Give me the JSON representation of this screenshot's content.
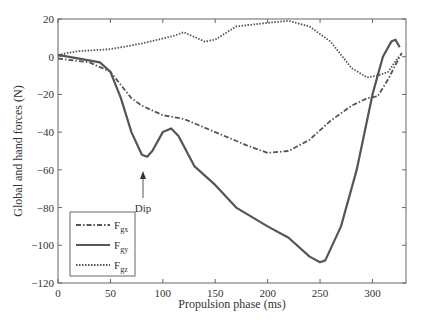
{
  "chart_data": {
    "type": "line",
    "title": "",
    "xlabel": "Propulsion phase (ms)",
    "ylabel": "Global and hand forces (N)",
    "xlim": [
      0,
      332
    ],
    "ylim": [
      -120,
      20
    ],
    "xticks": [
      0,
      50,
      100,
      150,
      200,
      250,
      300
    ],
    "yticks": [
      20,
      0,
      -20,
      -40,
      -60,
      -80,
      -100,
      -120
    ],
    "grid": false,
    "legend_position": "lower left",
    "series": [
      {
        "name": "Fgx",
        "label_main": "F",
        "label_sub": "gx",
        "style": "dash-dot",
        "x": [
          0,
          30,
          50,
          60,
          70,
          80,
          100,
          120,
          150,
          180,
          200,
          220,
          240,
          260,
          280,
          295,
          305,
          315,
          325,
          328
        ],
        "y": [
          -1,
          -3,
          -8,
          -15,
          -22,
          -26,
          -31,
          -33,
          -40,
          -47,
          -51,
          -50,
          -44,
          -34,
          -26,
          -22,
          -21,
          -12,
          -1,
          2
        ]
      },
      {
        "name": "Fgy",
        "label_main": "F",
        "label_sub": "gy",
        "style": "solid",
        "x": [
          0,
          20,
          40,
          50,
          60,
          70,
          80,
          85,
          90,
          100,
          108,
          115,
          130,
          150,
          170,
          200,
          220,
          240,
          250,
          255,
          270,
          285,
          300,
          310,
          318,
          322,
          326
        ],
        "y": [
          1,
          -1,
          -3,
          -8,
          -22,
          -40,
          -52,
          -53,
          -50,
          -40,
          -38,
          -42,
          -58,
          -68,
          -80,
          -90,
          -96,
          -106,
          -109,
          -108,
          -90,
          -60,
          -20,
          0,
          8,
          9,
          5
        ]
      },
      {
        "name": "Fgz",
        "label_main": "F",
        "label_sub": "gz",
        "style": "dotted",
        "x": [
          0,
          20,
          50,
          80,
          110,
          120,
          140,
          150,
          170,
          200,
          220,
          240,
          260,
          280,
          295,
          305,
          315,
          325
        ],
        "y": [
          1,
          3,
          4,
          7,
          11,
          13,
          8,
          9,
          16,
          18,
          19,
          16,
          8,
          -6,
          -11,
          -10,
          -8,
          0
        ]
      }
    ],
    "annotations": [
      {
        "text": "Dip",
        "x": 82,
        "y": -53,
        "arrow": true
      }
    ]
  },
  "colors": {
    "line": "#555555",
    "axis": "#666666",
    "text": "#333333"
  }
}
